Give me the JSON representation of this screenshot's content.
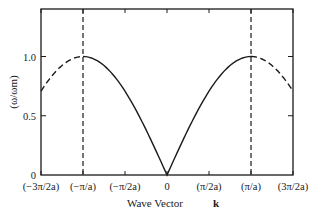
{
  "chart_data": {
    "type": "line",
    "title": "",
    "xlabel": "Wave Vector",
    "xlabel_symbol": "k",
    "ylabel": "(ω/ω_m)",
    "ylabel_display": "(ω/ωm)",
    "xlim": [
      -4.712,
      4.712
    ],
    "ylim": [
      0,
      1.25
    ],
    "x_tick_values": [
      -4.712,
      -3.1416,
      -1.5708,
      0,
      1.5708,
      3.1416,
      4.712
    ],
    "x_tick_labels": [
      "(−3π/2a)",
      "(−π/a)",
      "(−π/2a)",
      "0",
      "(π/2a)",
      "(π/a)",
      "(3π/2a)"
    ],
    "y_tick_values": [
      0,
      0.5,
      1.0
    ],
    "y_tick_labels": [
      "0",
      "0.5",
      "1.0"
    ],
    "grid": false,
    "legend": null,
    "function": "ω/ω_m = |sin(k a / 2)|",
    "series": [
      {
        "name": "dispersion (first Brillouin zone)",
        "style": "solid",
        "x": [
          -3.1416,
          -2.3562,
          -1.5708,
          -0.7854,
          0,
          0.7854,
          1.5708,
          2.3562,
          3.1416
        ],
        "values": [
          1.0,
          0.924,
          0.707,
          0.383,
          0.0,
          0.383,
          0.707,
          0.924,
          1.0
        ]
      },
      {
        "name": "extended zone (left)",
        "style": "dashed",
        "x": [
          -4.712,
          -3.927,
          -3.1416
        ],
        "values": [
          0.707,
          0.924,
          1.0
        ]
      },
      {
        "name": "extended zone (right)",
        "style": "dashed",
        "x": [
          3.1416,
          3.927,
          4.712
        ],
        "values": [
          1.0,
          0.924,
          0.707
        ]
      }
    ],
    "annotations": [
      {
        "type": "vertical-dashed-line",
        "x": -3.1416,
        "label": "(−π/a)"
      },
      {
        "type": "vertical-dashed-line",
        "x": 3.1416,
        "label": "(π/a)"
      }
    ]
  }
}
